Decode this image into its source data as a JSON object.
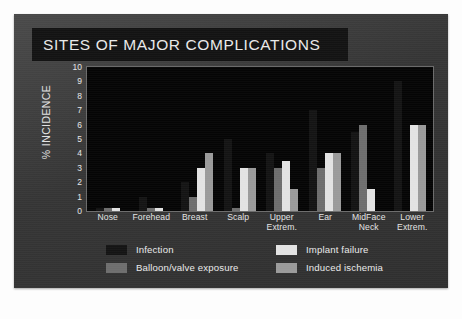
{
  "slide": {
    "title": "SITES OF MAJOR COMPLICATIONS"
  },
  "chart_data": {
    "type": "bar",
    "title": "SITES OF MAJOR COMPLICATIONS",
    "xlabel": "",
    "ylabel": "% INCIDENCE",
    "ylim": [
      0,
      10
    ],
    "yticks": [
      10,
      9,
      8,
      7,
      6,
      5,
      4,
      3,
      2,
      1,
      0
    ],
    "grid": false,
    "legend_position": "bottom",
    "categories": [
      "Nose",
      "Forehead",
      "Breast",
      "Scalp",
      "Upper Extrem.",
      "Ear",
      "MidFace Neck",
      "Lower Extrem."
    ],
    "category_lines": [
      [
        "Nose",
        ""
      ],
      [
        "Forehead",
        ""
      ],
      [
        "Breast",
        ""
      ],
      [
        "Scalp",
        ""
      ],
      [
        "Upper",
        "Extrem."
      ],
      [
        "Ear",
        ""
      ],
      [
        "MidFace",
        "Neck"
      ],
      [
        "Lower",
        "Extrem."
      ]
    ],
    "series": [
      {
        "name": "Infection",
        "color": "#141414",
        "values": [
          0.2,
          1.0,
          2.0,
          5.0,
          4.0,
          7.0,
          5.5,
          9.0
        ]
      },
      {
        "name": "Balloon/valve exposure",
        "color": "#6e6e6e",
        "values": [
          0.2,
          0.2,
          1.0,
          0.2,
          3.0,
          3.0,
          6.0,
          0.0
        ]
      },
      {
        "name": "Implant failure",
        "color": "#e2e2e2",
        "values": [
          0.2,
          0.2,
          3.0,
          3.0,
          3.5,
          4.0,
          1.5,
          6.0
        ]
      },
      {
        "name": "Induced ischemia",
        "color": "#9a9a9a",
        "values": [
          0.0,
          0.0,
          4.0,
          3.0,
          1.5,
          4.0,
          0.0,
          6.0
        ]
      }
    ]
  },
  "legend": {
    "items": [
      {
        "label": "Infection",
        "color": "#141414"
      },
      {
        "label": "Implant failure",
        "color": "#e2e2e2"
      },
      {
        "label": "Balloon/valve exposure",
        "color": "#6e6e6e"
      },
      {
        "label": "Induced ischemia",
        "color": "#9a9a9a"
      }
    ]
  }
}
